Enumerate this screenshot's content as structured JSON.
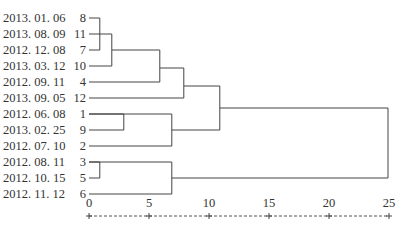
{
  "chart_data": {
    "type": "dendrogram",
    "title": "",
    "xlabel": "",
    "ylabel": "",
    "xlim": [
      0,
      25
    ],
    "x_ticks": [
      0,
      5,
      10,
      15,
      20,
      25
    ],
    "axis_style": "dashed with + tick marks",
    "leaves": [
      {
        "date": "2013. 01. 06",
        "id": "8"
      },
      {
        "date": "2013. 08. 09",
        "id": "11"
      },
      {
        "date": "2012. 12. 08",
        "id": "7"
      },
      {
        "date": "2013. 03. 12",
        "id": "10"
      },
      {
        "date": "2012. 09. 11",
        "id": "4"
      },
      {
        "date": "2013. 09. 05",
        "id": "12"
      },
      {
        "date": "2012. 06. 08",
        "id": "1"
      },
      {
        "date": "2013. 02. 25",
        "id": "9"
      },
      {
        "date": "2012. 07. 10",
        "id": "2"
      },
      {
        "date": "2012. 08. 11",
        "id": "3"
      },
      {
        "date": "2012. 10. 15",
        "id": "5"
      },
      {
        "date": "2012. 11. 12",
        "id": "6"
      }
    ],
    "merges": [
      {
        "a": "8",
        "b": "7",
        "distance": 0.9
      },
      {
        "a": "3",
        "b": "5",
        "distance": 0.9
      },
      {
        "a": "(8,7)+11",
        "b": "10",
        "distance": 1.9
      },
      {
        "a": "1",
        "b": "9",
        "distance": 2.9
      },
      {
        "a": "(8,11,7,10)",
        "b": "4",
        "distance": 5.9
      },
      {
        "a": "(1,9)",
        "b": "2",
        "distance": 6.9
      },
      {
        "a": "(3,5)",
        "b": "6",
        "distance": 6.9
      },
      {
        "a": "(8,11,7,10,4)",
        "b": "12",
        "distance": 7.9
      },
      {
        "a": "(8,11,7,10,4,12)",
        "b": "(1,9,2)",
        "distance": 10.9
      },
      {
        "a": "(8,11,7,10,4,12,1,9,2)",
        "b": "(3,5,6)",
        "distance": 25
      }
    ]
  },
  "axis": {
    "ticks": [
      "0",
      "5",
      "10",
      "15",
      "20",
      "25"
    ]
  }
}
